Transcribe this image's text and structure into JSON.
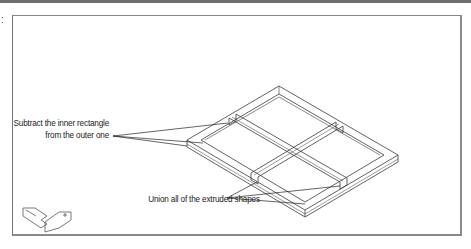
{
  "figure": {
    "margin_marker": ":",
    "annotations": [
      {
        "id": "subtract-line1",
        "text": "Subtract the inner rectangle"
      },
      {
        "id": "subtract-line2",
        "text": "from the outer one"
      },
      {
        "id": "union",
        "text": "Union all of the extruded shapes"
      }
    ],
    "ucs_icon": "ucs-icon"
  },
  "colors": {
    "line": "#333333",
    "frame_border": "#777777",
    "top_rule": "#6e6e6e"
  }
}
